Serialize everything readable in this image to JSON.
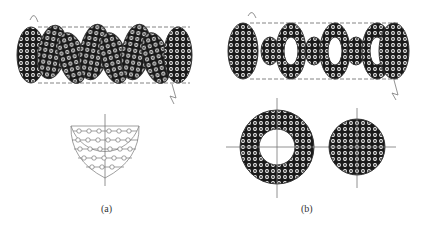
{
  "figure": {
    "panels": [
      {
        "id": "a",
        "label": "(a)",
        "description": "Segmental baffle shell with circular tube bundle and segment cut view"
      },
      {
        "id": "b",
        "label": "(b)",
        "description": "Disc-and-doughnut baffle shell with annular and disc baffle views"
      }
    ]
  },
  "colors": {
    "ink": "#1a1a1a",
    "outline": "#555555",
    "dashed": "#666666",
    "background": "#ffffff"
  }
}
